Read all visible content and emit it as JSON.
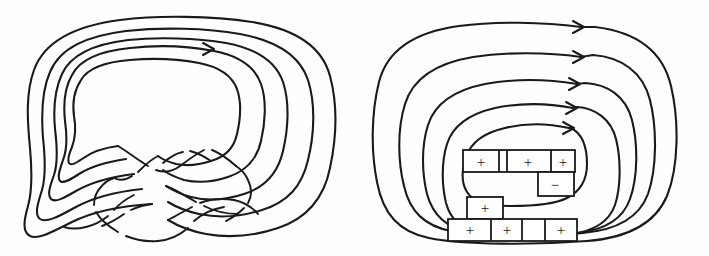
{
  "figure": {
    "background_color": "#fefefe",
    "ink_color": "#1a1a1a",
    "width": 709,
    "height": 256
  },
  "left_panel": {
    "name": "knot-diagram",
    "description": "Oriented knot diagram with four nested loops and a cluster of crossings at the bottom",
    "nested_loop_count": 4,
    "arrow_count": 1,
    "arrows": [
      {
        "label": "orientation-arrow",
        "x": 210,
        "y": 49,
        "direction": "right"
      }
    ],
    "crossing_count": 8
  },
  "right_panel": {
    "name": "seifert-surface-diagram",
    "description": "Five nested Seifert circles joined by signed twisted bands",
    "nested_circle_count": 5,
    "arrow_count": 5,
    "arrows": [
      {
        "label": "orientation-arrow-1",
        "x": 581,
        "y": 27,
        "direction": "right"
      },
      {
        "label": "orientation-arrow-2",
        "x": 581,
        "y": 57,
        "direction": "right"
      },
      {
        "label": "orientation-arrow-3",
        "x": 578,
        "y": 84,
        "direction": "right"
      },
      {
        "label": "orientation-arrow-4",
        "x": 575,
        "y": 108,
        "direction": "right"
      },
      {
        "label": "orientation-arrow-5",
        "x": 573,
        "y": 128,
        "direction": "right"
      }
    ],
    "bands": [
      {
        "id": "band-row1-a",
        "sign": "+",
        "row": 1,
        "x": 482,
        "y": 161
      },
      {
        "id": "band-row1-b",
        "sign": "+",
        "row": 1,
        "x": 518,
        "y": 161
      },
      {
        "id": "band-row1-c",
        "sign": "+",
        "row": 1,
        "x": 570,
        "y": 161
      },
      {
        "id": "band-row2-a",
        "sign": "−",
        "row": 2,
        "x": 549,
        "y": 185
      },
      {
        "id": "band-row3-a",
        "sign": "+",
        "row": 3,
        "x": 485,
        "y": 208
      },
      {
        "id": "band-row4-a",
        "sign": "+",
        "row": 4,
        "x": 472,
        "y": 230
      },
      {
        "id": "band-row4-b",
        "sign": "+",
        "row": 4,
        "x": 511,
        "y": 230
      },
      {
        "id": "band-row4-c",
        "sign": "+",
        "row": 4,
        "x": 562,
        "y": 230
      }
    ],
    "sign_summary": {
      "positive_count": 7,
      "negative_count": 1,
      "total_count": 8
    }
  }
}
